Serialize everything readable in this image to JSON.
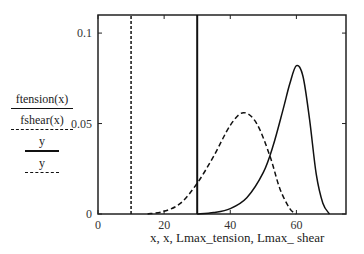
{
  "chart_data": {
    "type": "line",
    "title": "",
    "xlabel": "x, x, Lmax_tension, Lmax_ shear",
    "ylabel": "",
    "xlim": [
      0,
      75
    ],
    "ylim": [
      0,
      0.11
    ],
    "x_ticks": [
      0,
      20,
      40,
      60
    ],
    "x_tick_labels": [
      "0",
      "20",
      "40",
      "60"
    ],
    "y_ticks": [
      0,
      0.05,
      0.1
    ],
    "y_tick_labels": [
      "0",
      "0.05",
      "0.1"
    ],
    "grid": false,
    "legend_position": "left",
    "legend": [
      {
        "label": "ftension(x)",
        "style": "solid"
      },
      {
        "label": "fshear(x)",
        "style": "dashed"
      },
      {
        "label": "y",
        "style": "solid-thick"
      },
      {
        "label": "y",
        "style": "dotted"
      }
    ],
    "series": [
      {
        "name": "ftension(x)",
        "style": "solid",
        "shape": "skewed-peak",
        "x": [
          30,
          35,
          40,
          45,
          50,
          53,
          56,
          58,
          60,
          62,
          64,
          66,
          68,
          70
        ],
        "y": [
          0,
          0.0008,
          0.003,
          0.009,
          0.023,
          0.038,
          0.058,
          0.072,
          0.082,
          0.076,
          0.052,
          0.022,
          0.006,
          0
        ]
      },
      {
        "name": "fshear(x)",
        "style": "dashed",
        "shape": "skewed-peak",
        "x": [
          15,
          20,
          25,
          30,
          35,
          40,
          44,
          48,
          52,
          55,
          58,
          60
        ],
        "y": [
          0,
          0.0015,
          0.006,
          0.017,
          0.032,
          0.049,
          0.056,
          0.05,
          0.032,
          0.014,
          0.003,
          0
        ]
      },
      {
        "name": "Lmax_tension",
        "style": "solid-vertical",
        "x": [
          30,
          30
        ],
        "y": [
          0,
          0.11
        ]
      },
      {
        "name": "Lmax_shear",
        "style": "dotted-vertical",
        "x": [
          10,
          10
        ],
        "y": [
          0,
          0.11
        ]
      }
    ]
  },
  "legend": {
    "item1": "ftension(x)",
    "item2": "fshear(x)",
    "item3": "y",
    "item4": "y"
  },
  "axes": {
    "xlabel": "x, x, Lmax_tension, Lmax_ shear"
  }
}
